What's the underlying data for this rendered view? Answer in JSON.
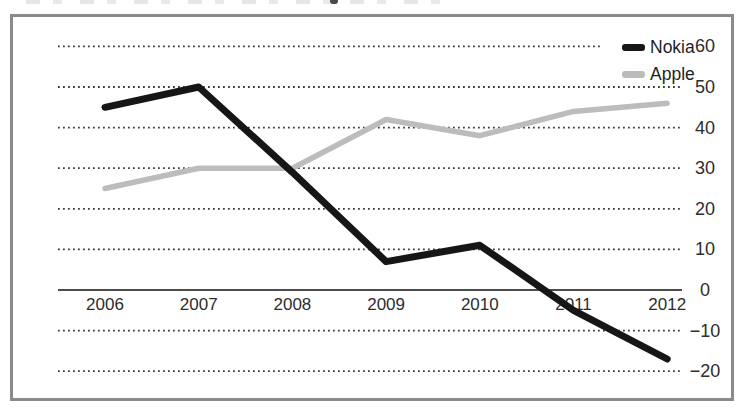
{
  "figure": {
    "background": "#ffffff",
    "frame_border_color": "#8a8a8a"
  },
  "chart_data": {
    "type": "line",
    "categories": [
      "2006",
      "2007",
      "2008",
      "2009",
      "2010",
      "2011",
      "2012"
    ],
    "series": [
      {
        "name": "Nokia",
        "color": "#161616",
        "values": [
          45,
          50,
          29,
          7,
          11,
          -5,
          -17
        ]
      },
      {
        "name": "Apple",
        "color": "#bcbcbc",
        "values": [
          25,
          30,
          30,
          42,
          38,
          44,
          46
        ]
      }
    ],
    "title": "",
    "xlabel": "",
    "ylabel": "",
    "ylim": [
      -20,
      60
    ],
    "yticks": [
      60,
      50,
      40,
      30,
      20,
      10,
      0,
      -10,
      -20
    ],
    "ytick_labels": [
      "60",
      "50",
      "40",
      "30",
      "20",
      "10",
      "0",
      "−10",
      "−20"
    ],
    "x_axis_at": 0,
    "grid": "horizontal-dotted",
    "legend_position": "top-right-inside",
    "y_axis_side": "right"
  }
}
